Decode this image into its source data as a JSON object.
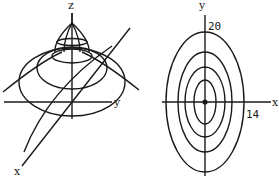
{
  "figure": {
    "left_panel": {
      "title": "3D surface with level curves",
      "axis_labels": {
        "z": "z",
        "y": "y",
        "x": "x"
      }
    },
    "right_panel": {
      "title": "Contour map",
      "axis_labels": {
        "y": "y",
        "x": "x"
      },
      "tick_labels": {
        "y": "20",
        "x": "14"
      },
      "contour_count": 4
    },
    "colors": {
      "ink": "#1a1a1a",
      "background": "#ffffff"
    }
  }
}
